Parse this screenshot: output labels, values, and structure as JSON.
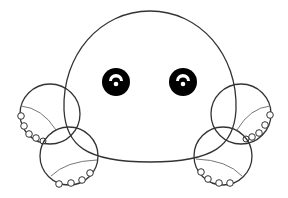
{
  "image": {
    "subject": "cartoon octopus line drawing",
    "caption": "Cute octopus outline with two eyes and four tentacles",
    "background_color": "#ffffff",
    "stroke_color": "#333333",
    "inner_line_color": "#777777",
    "eye_color": "#000000",
    "highlight_color": "#ffffff"
  },
  "head": {
    "cx": 150,
    "cy": 95,
    "rx": 86,
    "top": 11,
    "bottom": 162
  },
  "eyes": [
    {
      "name": "left",
      "cx": 116,
      "cy": 82,
      "r": 14
    },
    {
      "name": "right",
      "cx": 183,
      "cy": 82,
      "r": 14
    }
  ],
  "tentacles": [
    {
      "name": "upper-left",
      "cx": 50,
      "cy": 114,
      "r": 30
    },
    {
      "name": "lower-left",
      "cx": 69,
      "cy": 156,
      "r": 29
    },
    {
      "name": "upper-right",
      "cx": 241,
      "cy": 114,
      "r": 30
    },
    {
      "name": "lower-right",
      "cx": 223,
      "cy": 156,
      "r": 29
    }
  ]
}
